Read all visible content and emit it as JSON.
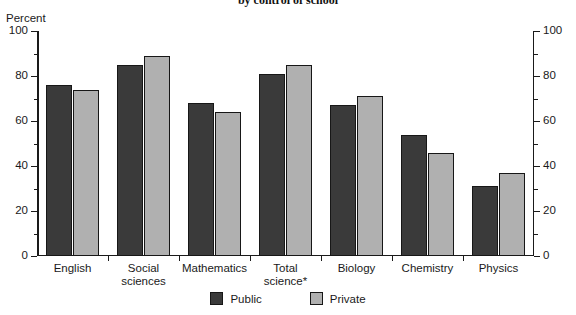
{
  "chart_data": {
    "type": "bar",
    "title": "by control of school",
    "xlabel": "",
    "ylabel": "Percent",
    "ylim": [
      0,
      100
    ],
    "y_ticks": [
      0,
      20,
      40,
      60,
      80,
      100
    ],
    "y_minor_ticks": [
      10,
      30,
      50,
      70,
      90
    ],
    "grid": false,
    "dual_axis": true,
    "legend_position": "bottom-center",
    "categories": [
      "English",
      "Social\nsciences",
      "Mathematics",
      "Total\nscience*",
      "Biology",
      "Chemistry",
      "Physics"
    ],
    "series": [
      {
        "name": "Public",
        "color": "#3a3a3a",
        "values": [
          76,
          85,
          68,
          81,
          67,
          54,
          31
        ]
      },
      {
        "name": "Private",
        "color": "#b0b0b0",
        "values": [
          74,
          89,
          64,
          85,
          71,
          46,
          37
        ]
      }
    ]
  },
  "axes": {
    "left_unit_label": "Percent",
    "tick_labels": [
      "100",
      "80",
      "60",
      "40",
      "20",
      "0"
    ]
  },
  "legend": {
    "items": [
      {
        "label": "Public",
        "color": "#3a3a3a"
      },
      {
        "label": "Private",
        "color": "#b0b0b0"
      }
    ]
  }
}
